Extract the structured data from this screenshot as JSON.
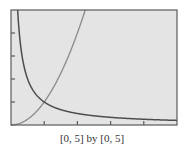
{
  "chart_data": {
    "type": "line",
    "title": "",
    "caption": "[0, 5] by [0, 5]",
    "xlabel": "",
    "ylabel": "",
    "xlim": [
      0,
      5
    ],
    "ylim": [
      0,
      5
    ],
    "xscale_ticks": [
      1,
      2,
      3,
      4
    ],
    "yscale_ticks": [
      1,
      2,
      3,
      4
    ],
    "grid": false,
    "legend": null,
    "series": [
      {
        "name": "y = x^2",
        "expr": "x^2",
        "color": "#8a8a8a",
        "x": [
          0,
          0.5,
          1,
          1.5,
          2,
          2.236
        ],
        "y": [
          0,
          0.25,
          1,
          2.25,
          4,
          5
        ]
      },
      {
        "name": "y = 1/x",
        "expr": "1/x",
        "color": "#4d4d4d",
        "x": [
          0.2,
          0.25,
          0.5,
          1,
          2,
          3,
          4,
          5
        ],
        "y": [
          5,
          4,
          2,
          1,
          0.5,
          0.333,
          0.25,
          0.2
        ]
      }
    ],
    "annotations": [
      {
        "text": "intersection",
        "x": 1,
        "y": 1
      }
    ]
  },
  "colors": {
    "plot_bg": "#e4e4e4",
    "frame": "#5a5a5a",
    "page_bg": "#ffffff"
  }
}
